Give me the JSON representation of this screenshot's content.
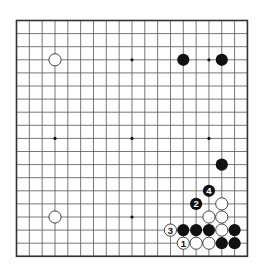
{
  "board": {
    "size": 19,
    "origin": {
      "x": 16.5,
      "y": 20.5
    },
    "spacing": {
      "x": 12.83,
      "y": 13.1
    },
    "colors": {
      "background": "#ffffff",
      "line": "#555555",
      "border": "#333333",
      "black_stone": "#111111",
      "white_stone": "#ffffff",
      "white_stroke": "#333333"
    },
    "star_points": [
      [
        3,
        3
      ],
      [
        9,
        3
      ],
      [
        15,
        3
      ],
      [
        3,
        9
      ],
      [
        9,
        9
      ],
      [
        15,
        9
      ],
      [
        3,
        15
      ],
      [
        9,
        15
      ],
      [
        15,
        15
      ]
    ],
    "stones": [
      {
        "color": "white",
        "col": 3,
        "row": 3,
        "label": ""
      },
      {
        "color": "black",
        "col": 13,
        "row": 3,
        "label": ""
      },
      {
        "color": "black",
        "col": 16,
        "row": 3,
        "label": ""
      },
      {
        "color": "white",
        "col": 3,
        "row": 15,
        "label": ""
      },
      {
        "color": "black",
        "col": 16,
        "row": 11,
        "label": ""
      },
      {
        "color": "black",
        "col": 15,
        "row": 13,
        "label": "4"
      },
      {
        "color": "black",
        "col": 14,
        "row": 14,
        "label": "2"
      },
      {
        "color": "white",
        "col": 16,
        "row": 14,
        "label": ""
      },
      {
        "color": "white",
        "col": 15,
        "row": 15,
        "label": ""
      },
      {
        "color": "white",
        "col": 16,
        "row": 15,
        "label": ""
      },
      {
        "color": "white",
        "col": 12,
        "row": 16,
        "label": "3"
      },
      {
        "color": "black",
        "col": 13,
        "row": 16,
        "label": ""
      },
      {
        "color": "black",
        "col": 14,
        "row": 16,
        "label": ""
      },
      {
        "color": "black",
        "col": 15,
        "row": 16,
        "label": ""
      },
      {
        "color": "white",
        "col": 16,
        "row": 16,
        "label": ""
      },
      {
        "color": "black",
        "col": 17,
        "row": 16,
        "label": ""
      },
      {
        "color": "white",
        "col": 13,
        "row": 17,
        "label": "1"
      },
      {
        "color": "white",
        "col": 14,
        "row": 17,
        "label": ""
      },
      {
        "color": "white",
        "col": 15,
        "row": 17,
        "label": ""
      },
      {
        "color": "black",
        "col": 16,
        "row": 17,
        "label": ""
      },
      {
        "color": "black",
        "col": 17,
        "row": 17,
        "label": ""
      }
    ]
  }
}
